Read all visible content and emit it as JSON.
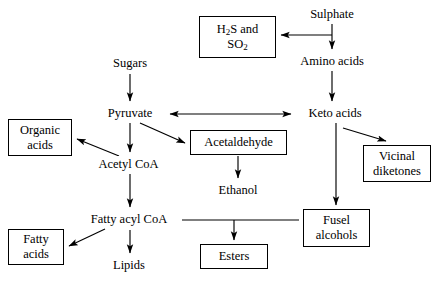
{
  "diagram": {
    "stroke_color": "#000000",
    "background_color": "#ffffff",
    "nodes": [
      {
        "id": "sulphate",
        "label": "Sulphate",
        "boxed": false,
        "x": 296,
        "y": 6,
        "w": 72,
        "h": 17
      },
      {
        "id": "h2s_so2",
        "label": "H₂S and\nSO₂",
        "boxed": true,
        "x": 199,
        "y": 16,
        "w": 77,
        "h": 42
      },
      {
        "id": "amino_acids",
        "label": "Amino acids",
        "boxed": false,
        "x": 287,
        "y": 53,
        "w": 90,
        "h": 17
      },
      {
        "id": "sugars",
        "label": "Sugars",
        "boxed": false,
        "x": 100,
        "y": 55,
        "w": 60,
        "h": 17
      },
      {
        "id": "pyruvate",
        "label": "Pyruvate",
        "boxed": false,
        "x": 97,
        "y": 105,
        "w": 66,
        "h": 17
      },
      {
        "id": "keto_acids",
        "label": "Keto acids",
        "boxed": false,
        "x": 297,
        "y": 105,
        "w": 76,
        "h": 17
      },
      {
        "id": "organic_acids",
        "label": "Organic\nacids",
        "boxed": true,
        "x": 8,
        "y": 119,
        "w": 64,
        "h": 37
      },
      {
        "id": "acetaldehyde",
        "label": "Acetaldehyde",
        "boxed": true,
        "x": 190,
        "y": 130,
        "w": 97,
        "h": 25
      },
      {
        "id": "vicinal",
        "label": "Vicinal\ndiketones",
        "boxed": true,
        "x": 363,
        "y": 145,
        "w": 68,
        "h": 37
      },
      {
        "id": "acetyl_coa",
        "label": "Acetyl CoA",
        "boxed": false,
        "x": 89,
        "y": 156,
        "w": 79,
        "h": 17
      },
      {
        "id": "ethanol",
        "label": "Ethanol",
        "boxed": false,
        "x": 207,
        "y": 182,
        "w": 62,
        "h": 17
      },
      {
        "id": "fusel_alcohols",
        "label": "Fusel\nalcohols",
        "boxed": true,
        "x": 303,
        "y": 209,
        "w": 67,
        "h": 38
      },
      {
        "id": "fatty_acyl_coa",
        "label": "Fatty acyl CoA",
        "boxed": false,
        "x": 79,
        "y": 211,
        "w": 100,
        "h": 17
      },
      {
        "id": "fatty_acids",
        "label": "Fatty\nacids",
        "boxed": true,
        "x": 8,
        "y": 229,
        "w": 56,
        "h": 36
      },
      {
        "id": "esters",
        "label": "Esters",
        "boxed": true,
        "x": 200,
        "y": 244,
        "w": 68,
        "h": 25
      },
      {
        "id": "lipids",
        "label": "Lipids",
        "boxed": false,
        "x": 102,
        "y": 257,
        "w": 54,
        "h": 17
      }
    ],
    "edges": [
      {
        "id": "sulphate-to-h2s",
        "from": "sulphate",
        "to": "h2s_so2",
        "kind": "elbow-left",
        "arrow": "single"
      },
      {
        "id": "sulphate-to-amino-acids",
        "from": "sulphate",
        "to": "amino_acids",
        "kind": "vertical",
        "arrow": "single"
      },
      {
        "id": "amino-acids-to-keto-acids",
        "from": "amino_acids",
        "to": "keto_acids",
        "kind": "vertical",
        "arrow": "single"
      },
      {
        "id": "sugars-to-pyruvate",
        "from": "sugars",
        "to": "pyruvate",
        "kind": "vertical",
        "arrow": "single"
      },
      {
        "id": "pyruvate-keto-acids",
        "from": "pyruvate",
        "to": "keto_acids",
        "kind": "horizontal",
        "arrow": "double"
      },
      {
        "id": "pyruvate-to-acetyl-coa",
        "from": "pyruvate",
        "to": "acetyl_coa",
        "kind": "vertical",
        "arrow": "single"
      },
      {
        "id": "pyruvate-to-acetaldehyde",
        "from": "pyruvate",
        "to": "acetaldehyde",
        "kind": "diagonal",
        "arrow": "single"
      },
      {
        "id": "acetyl-coa-to-organic-acids",
        "from": "acetyl_coa",
        "to": "organic_acids",
        "kind": "diagonal",
        "arrow": "single"
      },
      {
        "id": "acetyl-coa-to-fatty-acyl",
        "from": "acetyl_coa",
        "to": "fatty_acyl_coa",
        "kind": "vertical",
        "arrow": "single"
      },
      {
        "id": "acetaldehyde-to-ethanol",
        "from": "acetaldehyde",
        "to": "ethanol",
        "kind": "vertical",
        "arrow": "single"
      },
      {
        "id": "keto-acids-to-vicinal",
        "from": "keto_acids",
        "to": "vicinal",
        "kind": "diagonal",
        "arrow": "single"
      },
      {
        "id": "keto-acids-to-fusel",
        "from": "keto_acids",
        "to": "fusel_alcohols",
        "kind": "vertical",
        "arrow": "single"
      },
      {
        "id": "fatty-acyl-to-fatty-acids",
        "from": "fatty_acyl_coa",
        "to": "fatty_acids",
        "kind": "diagonal",
        "arrow": "single"
      },
      {
        "id": "fatty-acyl-to-lipids",
        "from": "fatty_acyl_coa",
        "to": "lipids",
        "kind": "vertical",
        "arrow": "single"
      },
      {
        "id": "fusel-fatty-acyl-to-esters",
        "from": "fusel_alcohols",
        "to": "esters",
        "kind": "tee-down",
        "arrow": "single"
      }
    ]
  }
}
